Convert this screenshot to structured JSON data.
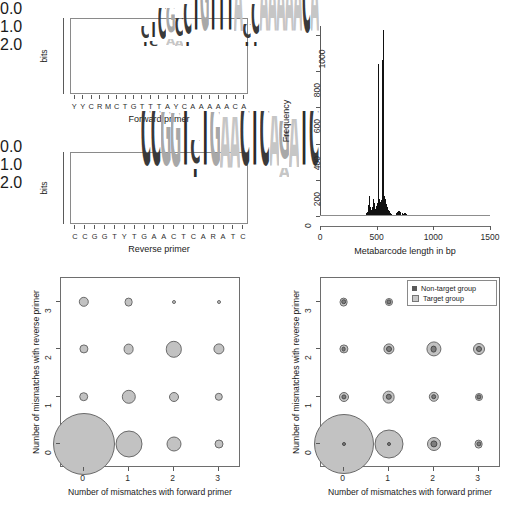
{
  "figure": {
    "panels": [
      "forward-primer-logo",
      "metabarcode-length-histogram",
      "target-bubble-plot",
      "nontarget-bubble-plot"
    ]
  },
  "logo_forward": {
    "caption": "Forward primer",
    "y_axis_label": "bits",
    "y_ticks": [
      "0.0",
      "1.0",
      "2.0"
    ],
    "y_range": [
      0,
      2
    ],
    "consensus": [
      "Y",
      "Y",
      "C",
      "R",
      "M",
      "C",
      "T",
      "G",
      "T",
      "T",
      "T",
      "A",
      "Y",
      "C",
      "A",
      "A",
      "A",
      "A",
      "A",
      "C",
      "A"
    ],
    "columns": [
      {
        "pos": 1,
        "letters": [
          {
            "base": "T",
            "bits": 0.14
          },
          {
            "base": "C",
            "bits": 0.42
          }
        ]
      },
      {
        "pos": 2,
        "letters": [
          {
            "base": "C",
            "bits": 0.16
          },
          {
            "base": "T",
            "bits": 0.5
          }
        ]
      },
      {
        "pos": 3,
        "letters": [
          {
            "base": "C",
            "bits": 1.02
          }
        ]
      },
      {
        "pos": 4,
        "letters": [
          {
            "base": "A",
            "bits": 0.2
          },
          {
            "base": "G",
            "bits": 0.82
          }
        ]
      },
      {
        "pos": 5,
        "letters": [
          {
            "base": "A",
            "bits": 0.16
          },
          {
            "base": "C",
            "bits": 0.6
          }
        ]
      },
      {
        "pos": 6,
        "letters": [
          {
            "base": "T",
            "bits": 0.12
          },
          {
            "base": "C",
            "bits": 1.0
          }
        ]
      },
      {
        "pos": 7,
        "letters": [
          {
            "base": "T",
            "bits": 1.88
          }
        ]
      },
      {
        "pos": 8,
        "letters": [
          {
            "base": "G",
            "bits": 1.86
          }
        ]
      },
      {
        "pos": 9,
        "letters": [
          {
            "base": "T",
            "bits": 1.9
          }
        ]
      },
      {
        "pos": 10,
        "letters": [
          {
            "base": "T",
            "bits": 1.9
          }
        ]
      },
      {
        "pos": 11,
        "letters": [
          {
            "base": "T",
            "bits": 1.88
          }
        ]
      },
      {
        "pos": 12,
        "letters": [
          {
            "base": "A",
            "bits": 1.82
          }
        ]
      },
      {
        "pos": 13,
        "letters": [
          {
            "base": "T",
            "bits": 0.14
          },
          {
            "base": "C",
            "bits": 0.46
          }
        ]
      },
      {
        "pos": 14,
        "letters": [
          {
            "base": "T",
            "bits": 0.14
          },
          {
            "base": "C",
            "bits": 1.0
          }
        ]
      },
      {
        "pos": 15,
        "letters": [
          {
            "base": "A",
            "bits": 1.78
          }
        ]
      },
      {
        "pos": 16,
        "letters": [
          {
            "base": "A",
            "bits": 1.8
          }
        ]
      },
      {
        "pos": 17,
        "letters": [
          {
            "base": "A",
            "bits": 1.8
          }
        ]
      },
      {
        "pos": 18,
        "letters": [
          {
            "base": "A",
            "bits": 1.8
          }
        ]
      },
      {
        "pos": 19,
        "letters": [
          {
            "base": "A",
            "bits": 1.78
          }
        ]
      },
      {
        "pos": 20,
        "letters": [
          {
            "base": "C",
            "bits": 1.72
          }
        ]
      },
      {
        "pos": 21,
        "letters": [
          {
            "base": "A",
            "bits": 1.78
          }
        ]
      }
    ]
  },
  "logo_reverse": {
    "caption": "Reverse primer",
    "y_axis_label": "bits",
    "y_ticks": [
      "0.0",
      "1.0",
      "2.0"
    ],
    "y_range": [
      0,
      2
    ],
    "consensus": [
      "C",
      "C",
      "G",
      "G",
      "T",
      "Y",
      "T",
      "G",
      "A",
      "A",
      "C",
      "T",
      "C",
      "A",
      "R",
      "A",
      "T",
      "C"
    ],
    "columns": [
      {
        "pos": 1,
        "letters": [
          {
            "base": "C",
            "bits": 1.9
          }
        ]
      },
      {
        "pos": 2,
        "letters": [
          {
            "base": "C",
            "bits": 1.9
          }
        ]
      },
      {
        "pos": 3,
        "letters": [
          {
            "base": "G",
            "bits": 1.86
          }
        ]
      },
      {
        "pos": 4,
        "letters": [
          {
            "base": "G",
            "bits": 1.84
          }
        ]
      },
      {
        "pos": 5,
        "letters": [
          {
            "base": "T",
            "bits": 1.9
          }
        ]
      },
      {
        "pos": 6,
        "letters": [
          {
            "base": "T",
            "bits": 0.28
          },
          {
            "base": "C",
            "bits": 0.8
          }
        ]
      },
      {
        "pos": 7,
        "letters": [
          {
            "base": "T",
            "bits": 1.9
          }
        ]
      },
      {
        "pos": 8,
        "letters": [
          {
            "base": "G",
            "bits": 1.86
          }
        ]
      },
      {
        "pos": 9,
        "letters": [
          {
            "base": "A",
            "bits": 1.72
          }
        ]
      },
      {
        "pos": 10,
        "letters": [
          {
            "base": "A",
            "bits": 1.72
          }
        ]
      },
      {
        "pos": 11,
        "letters": [
          {
            "base": "C",
            "bits": 1.9
          }
        ]
      },
      {
        "pos": 12,
        "letters": [
          {
            "base": "T",
            "bits": 1.88
          }
        ]
      },
      {
        "pos": 13,
        "letters": [
          {
            "base": "C",
            "bits": 1.88
          }
        ]
      },
      {
        "pos": 14,
        "letters": [
          {
            "base": "A",
            "bits": 1.74
          }
        ]
      },
      {
        "pos": 15,
        "letters": [
          {
            "base": "A",
            "bits": 0.3
          },
          {
            "base": "G",
            "bits": 1.32
          }
        ]
      },
      {
        "pos": 16,
        "letters": [
          {
            "base": "A",
            "bits": 1.68
          }
        ]
      },
      {
        "pos": 17,
        "letters": [
          {
            "base": "T",
            "bits": 1.88
          }
        ]
      },
      {
        "pos": 18,
        "letters": [
          {
            "base": "C",
            "bits": 1.88
          }
        ]
      }
    ]
  },
  "chart_data": [
    {
      "type": "bar",
      "name": "metabarcode-length-histogram",
      "title": "",
      "xlabel": "Metabarcode length in bp",
      "ylabel": "Frequency",
      "xlim": [
        0,
        1500
      ],
      "ylim": [
        0,
        1050
      ],
      "x_ticks": [
        0,
        500,
        1000,
        1500
      ],
      "y_ticks": [
        0,
        200,
        400,
        600,
        800,
        1000
      ],
      "grid": false,
      "bin_width": 5,
      "bins": [
        {
          "x": 395,
          "y": 4
        },
        {
          "x": 400,
          "y": 6
        },
        {
          "x": 405,
          "y": 10
        },
        {
          "x": 410,
          "y": 14
        },
        {
          "x": 415,
          "y": 22
        },
        {
          "x": 420,
          "y": 35
        },
        {
          "x": 425,
          "y": 60
        },
        {
          "x": 430,
          "y": 110
        },
        {
          "x": 435,
          "y": 75
        },
        {
          "x": 440,
          "y": 48
        },
        {
          "x": 445,
          "y": 40
        },
        {
          "x": 450,
          "y": 34
        },
        {
          "x": 455,
          "y": 30
        },
        {
          "x": 460,
          "y": 48
        },
        {
          "x": 465,
          "y": 66
        },
        {
          "x": 470,
          "y": 92
        },
        {
          "x": 475,
          "y": 70
        },
        {
          "x": 480,
          "y": 50
        },
        {
          "x": 485,
          "y": 40
        },
        {
          "x": 490,
          "y": 45
        },
        {
          "x": 495,
          "y": 55
        },
        {
          "x": 500,
          "y": 70
        },
        {
          "x": 505,
          "y": 60
        },
        {
          "x": 510,
          "y": 65
        },
        {
          "x": 515,
          "y": 840
        },
        {
          "x": 520,
          "y": 95
        },
        {
          "x": 525,
          "y": 80
        },
        {
          "x": 530,
          "y": 70
        },
        {
          "x": 535,
          "y": 78
        },
        {
          "x": 540,
          "y": 88
        },
        {
          "x": 545,
          "y": 860
        },
        {
          "x": 550,
          "y": 120
        },
        {
          "x": 555,
          "y": 1030
        },
        {
          "x": 560,
          "y": 150
        },
        {
          "x": 565,
          "y": 110
        },
        {
          "x": 570,
          "y": 95
        },
        {
          "x": 575,
          "y": 80
        },
        {
          "x": 580,
          "y": 66
        },
        {
          "x": 585,
          "y": 58
        },
        {
          "x": 590,
          "y": 48
        },
        {
          "x": 595,
          "y": 40
        },
        {
          "x": 600,
          "y": 34
        },
        {
          "x": 605,
          "y": 28
        },
        {
          "x": 610,
          "y": 22
        },
        {
          "x": 615,
          "y": 18
        },
        {
          "x": 620,
          "y": 15
        },
        {
          "x": 625,
          "y": 12
        },
        {
          "x": 630,
          "y": 10
        },
        {
          "x": 640,
          "y": 8
        },
        {
          "x": 650,
          "y": 7
        },
        {
          "x": 660,
          "y": 6
        },
        {
          "x": 670,
          "y": 14
        },
        {
          "x": 680,
          "y": 20
        },
        {
          "x": 690,
          "y": 26
        },
        {
          "x": 700,
          "y": 30
        },
        {
          "x": 710,
          "y": 22
        },
        {
          "x": 720,
          "y": 16
        },
        {
          "x": 730,
          "y": 12
        },
        {
          "x": 740,
          "y": 18
        },
        {
          "x": 750,
          "y": 14
        },
        {
          "x": 760,
          "y": 9
        },
        {
          "x": 775,
          "y": 6
        },
        {
          "x": 790,
          "y": 5
        },
        {
          "x": 810,
          "y": 4
        },
        {
          "x": 840,
          "y": 3
        },
        {
          "x": 880,
          "y": 3
        },
        {
          "x": 930,
          "y": 2
        },
        {
          "x": 1000,
          "y": 2
        },
        {
          "x": 1080,
          "y": 2
        },
        {
          "x": 1180,
          "y": 2
        },
        {
          "x": 1290,
          "y": 2
        },
        {
          "x": 1380,
          "y": 2
        }
      ]
    },
    {
      "type": "scatter",
      "name": "target-bubble-plot",
      "xlabel": "Number of mismatches with forward primer",
      "ylabel": "Number of mismatches with reverse primer",
      "x_ticks": [
        0,
        1,
        2,
        3
      ],
      "y_ticks": [
        0,
        1,
        2,
        3
      ],
      "xlim": [
        -0.5,
        3.5
      ],
      "ylim": [
        -0.5,
        3.5
      ],
      "grid": false,
      "legend": null,
      "series": [
        {
          "name": "Target group",
          "color": "#c2c2c2",
          "points": [
            {
              "x": 0,
              "y": 0,
              "r": 31.0
            },
            {
              "x": 1,
              "y": 0,
              "r": 13.5
            },
            {
              "x": 2,
              "y": 0,
              "r": 7.5
            },
            {
              "x": 3,
              "y": 0,
              "r": 4.5
            },
            {
              "x": 0,
              "y": 1,
              "r": 4.8
            },
            {
              "x": 1,
              "y": 1,
              "r": 7.2
            },
            {
              "x": 2,
              "y": 1,
              "r": 5.0
            },
            {
              "x": 3,
              "y": 1,
              "r": 4.2
            },
            {
              "x": 0,
              "y": 2,
              "r": 4.6
            },
            {
              "x": 1,
              "y": 2,
              "r": 5.4
            },
            {
              "x": 2,
              "y": 2,
              "r": 8.2
            },
            {
              "x": 3,
              "y": 2,
              "r": 5.6
            },
            {
              "x": 0,
              "y": 3,
              "r": 5.2
            },
            {
              "x": 1,
              "y": 3,
              "r": 4.4
            },
            {
              "x": 2,
              "y": 3,
              "r": 2.0
            },
            {
              "x": 3,
              "y": 3,
              "r": 2.0
            }
          ]
        }
      ]
    },
    {
      "type": "scatter",
      "name": "nontarget-bubble-plot",
      "xlabel": "Number of mismatches with forward primer",
      "ylabel": "Number of mismatches with reverse primer",
      "x_ticks": [
        0,
        1,
        2,
        3
      ],
      "y_ticks": [
        0,
        1,
        2,
        3
      ],
      "xlim": [
        -0.5,
        3.5
      ],
      "ylim": [
        -0.5,
        3.5
      ],
      "grid": false,
      "legend": {
        "position": "top-right",
        "entries": [
          "Non-target group",
          "Target group"
        ]
      },
      "series": [
        {
          "name": "Target group",
          "color": "#c2c2c2",
          "points": [
            {
              "x": 0,
              "y": 0,
              "r": 30.0
            },
            {
              "x": 1,
              "y": 0,
              "r": 14.5
            },
            {
              "x": 2,
              "y": 0,
              "r": 7.0
            },
            {
              "x": 3,
              "y": 0,
              "r": 4.4
            },
            {
              "x": 0,
              "y": 1,
              "r": 5.0
            },
            {
              "x": 1,
              "y": 1,
              "r": 6.4
            },
            {
              "x": 2,
              "y": 1,
              "r": 5.2
            },
            {
              "x": 3,
              "y": 1,
              "r": 4.0
            },
            {
              "x": 0,
              "y": 2,
              "r": 4.6
            },
            {
              "x": 1,
              "y": 2,
              "r": 5.6
            },
            {
              "x": 2,
              "y": 2,
              "r": 7.6
            },
            {
              "x": 3,
              "y": 2,
              "r": 6.0
            },
            {
              "x": 0,
              "y": 3,
              "r": 4.4
            },
            {
              "x": 1,
              "y": 3,
              "r": 4.0
            },
            {
              "x": 2,
              "y": 3,
              "r": 2.2
            },
            {
              "x": 3,
              "y": 3,
              "r": 2.2
            }
          ]
        },
        {
          "name": "Non-target group",
          "color": "#7d7d7d",
          "points": [
            {
              "x": 0,
              "y": 0,
              "r": 2.0
            },
            {
              "x": 1,
              "y": 0,
              "r": 2.0
            },
            {
              "x": 2,
              "y": 0,
              "r": 3.6
            },
            {
              "x": 3,
              "y": 0,
              "r": 2.6
            },
            {
              "x": 0,
              "y": 1,
              "r": 2.6
            },
            {
              "x": 1,
              "y": 1,
              "r": 3.2
            },
            {
              "x": 2,
              "y": 1,
              "r": 2.8
            },
            {
              "x": 3,
              "y": 1,
              "r": 2.6
            },
            {
              "x": 0,
              "y": 2,
              "r": 2.4
            },
            {
              "x": 1,
              "y": 2,
              "r": 3.0
            },
            {
              "x": 2,
              "y": 2,
              "r": 3.4
            },
            {
              "x": 3,
              "y": 2,
              "r": 3.0
            },
            {
              "x": 0,
              "y": 3,
              "r": 2.8
            },
            {
              "x": 1,
              "y": 3,
              "r": 2.6
            },
            {
              "x": 2,
              "y": 3,
              "r": 2.4
            },
            {
              "x": 3,
              "y": 3,
              "r": 2.4
            }
          ]
        }
      ]
    }
  ],
  "colors": {
    "base_A": "#c6c6c6",
    "base_C": "#3a3a3a",
    "base_G": "#a8a8a8",
    "base_T": "#2b2b2b",
    "histogram_bar": "#111111",
    "target_group": "#c2c2c2",
    "nontarget_group": "#7d7d7d",
    "axis": "#5a5a5a"
  }
}
